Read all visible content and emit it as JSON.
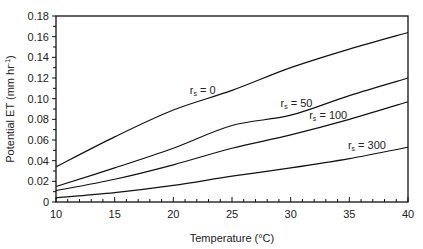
{
  "chart_data": {
    "type": "line",
    "title": "",
    "xlabel": "Temperature (°C)",
    "ylabel": "Potential ET (mm hr",
    "ylabel_sup": "-1",
    "ylabel_end": ")",
    "xlim": [
      10,
      40
    ],
    "ylim": [
      0,
      0.18
    ],
    "x_ticks": [
      10,
      15,
      20,
      25,
      30,
      35,
      40
    ],
    "x_tick_labels": [
      "10",
      "15",
      "20",
      "25",
      "30",
      "35",
      "40"
    ],
    "x_minor_step": 1,
    "y_ticks": [
      0,
      0.02,
      0.04,
      0.06,
      0.08,
      0.1,
      0.12,
      0.14,
      0.16,
      0.18
    ],
    "y_tick_labels": [
      "0",
      "0.02",
      "0.04",
      "0.06",
      "0.08",
      "0.10",
      "0.12",
      "0.14",
      "0.16",
      "0.18"
    ],
    "grid": false,
    "x": [
      10,
      15,
      20,
      25,
      30,
      35,
      40
    ],
    "series": [
      {
        "name": "rs = 0",
        "label_main": "r",
        "label_sub": "s",
        "label_rest": " = 0",
        "label_at_x": 22.5,
        "values": [
          0.034,
          0.063,
          0.089,
          0.108,
          0.13,
          0.148,
          0.164
        ]
      },
      {
        "name": "rs = 50",
        "label_main": "r",
        "label_sub": "s",
        "label_rest": " = 50",
        "label_at_x": 30.5,
        "values": [
          0.015,
          0.033,
          0.052,
          0.074,
          0.084,
          0.103,
          0.12
        ]
      },
      {
        "name": "rs = 100",
        "label_main": "r",
        "label_sub": "s",
        "label_rest": " = 100",
        "label_at_x": 33.2,
        "values": [
          0.011,
          0.022,
          0.036,
          0.052,
          0.065,
          0.08,
          0.097
        ]
      },
      {
        "name": "rs = 300",
        "label_main": "r",
        "label_sub": "s",
        "label_rest": " = 300",
        "label_at_x": 36.5,
        "values": [
          0.004,
          0.009,
          0.016,
          0.025,
          0.033,
          0.042,
          0.053
        ]
      }
    ]
  }
}
